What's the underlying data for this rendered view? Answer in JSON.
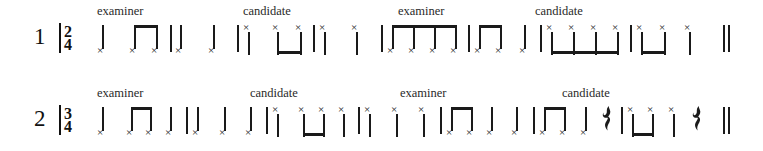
{
  "page": {
    "background_color": "#ffffff",
    "ink_color": "#1a1a1a"
  },
  "systems": [
    {
      "number": "1",
      "time_signature": {
        "beats": "2",
        "beat_type": "4",
        "display": "2/4"
      },
      "labels": [
        {
          "text": "examiner",
          "x": 97
        },
        {
          "text": "candidate",
          "x": 243
        },
        {
          "text": "examiner",
          "x": 398
        },
        {
          "text": "candidate",
          "x": 535
        }
      ],
      "measures": [
        {
          "role": "examiner",
          "notes": "quarter, two-beamed-eighths"
        },
        {
          "role": "examiner",
          "notes": "quarter, quarter"
        },
        {
          "role": "candidate",
          "notes": "quarter, two-beamed-eighths"
        },
        {
          "role": "candidate",
          "notes": "quarter, quarter"
        },
        {
          "role": "examiner",
          "notes": "four-beamed-sixteenths"
        },
        {
          "role": "examiner",
          "notes": "two-beamed-eighths, quarter"
        },
        {
          "role": "candidate",
          "notes": "four-beamed-sixteenths"
        },
        {
          "role": "candidate",
          "notes": "two-beamed-eighths, quarter"
        }
      ],
      "ending": "final-double-barline"
    },
    {
      "number": "2",
      "time_signature": {
        "beats": "3",
        "beat_type": "4",
        "display": "3/4"
      },
      "labels": [
        {
          "text": "examiner",
          "x": 97
        },
        {
          "text": "candidate",
          "x": 250
        },
        {
          "text": "examiner",
          "x": 400
        },
        {
          "text": "candidate",
          "x": 562
        }
      ],
      "measures": [
        {
          "role": "examiner",
          "notes": "quarter, two-beamed-eighths, quarter"
        },
        {
          "role": "examiner",
          "notes": "quarter, quarter, quarter"
        },
        {
          "role": "candidate",
          "notes": "quarter, two-beamed-eighths, quarter"
        },
        {
          "role": "candidate",
          "notes": "quarter, quarter, quarter"
        },
        {
          "role": "examiner",
          "notes": "two-beamed-eighths, quarter, quarter"
        },
        {
          "role": "examiner",
          "notes": "two-beamed-eighths, quarter, quarter-rest"
        },
        {
          "role": "candidate",
          "notes": "two-beamed-eighths, quarter, quarter"
        },
        {
          "role": "candidate",
          "notes": "two-beamed-eighths, quarter, quarter-rest"
        }
      ],
      "ending": "final-double-barline"
    }
  ],
  "glyphs": {
    "notehead": "×",
    "quarter_rest": "⸺",
    "barline": "|",
    "final_barline": "||"
  }
}
